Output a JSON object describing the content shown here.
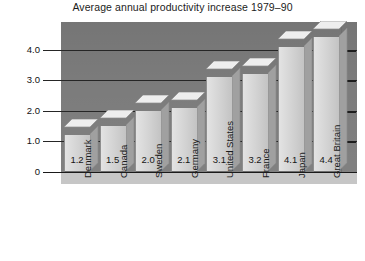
{
  "chart_data": {
    "type": "bar",
    "title": "Average annual productivity increase 1979–90",
    "xlabel": "",
    "ylabel": "",
    "categories": [
      "Denmark",
      "Canada",
      "Sweden",
      "Germany",
      "United States",
      "France",
      "Japan",
      "Great Britain"
    ],
    "values": [
      1.2,
      1.5,
      2.0,
      2.1,
      3.1,
      3.2,
      4.1,
      4.4
    ],
    "value_labels": [
      "1.2",
      "1.5",
      "2.0",
      "2.1",
      "3.1",
      "3.2",
      "4.1",
      "4.4"
    ],
    "ylim": [
      0,
      4.6
    ],
    "yticks": [
      0,
      1.0,
      2.0,
      3.0,
      4.0
    ],
    "ytick_labels": [
      "0",
      "1.0",
      "2.0",
      "3.0",
      "4.0"
    ],
    "grid": true,
    "legend": null,
    "style": "3d-bars",
    "colors": {
      "plot_background": "#7c7c7c",
      "floor": "#c6c6c6",
      "bar_front": "#d6d6d6",
      "bar_top": "#eeeeee",
      "bar_side": "#a0a0a0",
      "gridline": "#262626",
      "text": "#1a1a1a",
      "page_background": "#ffffff"
    }
  }
}
